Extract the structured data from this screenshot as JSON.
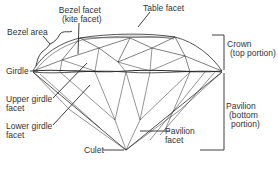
{
  "colors": {
    "line": "#2a2a2a",
    "text": "#333333",
    "background": "#ffffff"
  },
  "labels": {
    "bezel_facet": {
      "line1": "Bezel facet",
      "line2": "(kite facet)"
    },
    "table_facet": {
      "line1": "Table facet"
    },
    "bezel_area": {
      "line1": "Bezel area"
    },
    "girdle": {
      "line1": "Girdle"
    },
    "upper_girdle_facet": {
      "line1": "Upper girdle",
      "line2": "facet"
    },
    "lower_girdle_facet": {
      "line1": "Lower girdle",
      "line2": "facet"
    },
    "culet": {
      "line1": "Culet"
    },
    "pavilion_facet": {
      "line1": "Pavilion",
      "line2": "facet"
    },
    "crown": {
      "line1": "Crown",
      "line2": "(top portion)"
    },
    "pavilion": {
      "line1": "Pavilion",
      "line2": "(bottom",
      "line3": "portion)"
    }
  }
}
